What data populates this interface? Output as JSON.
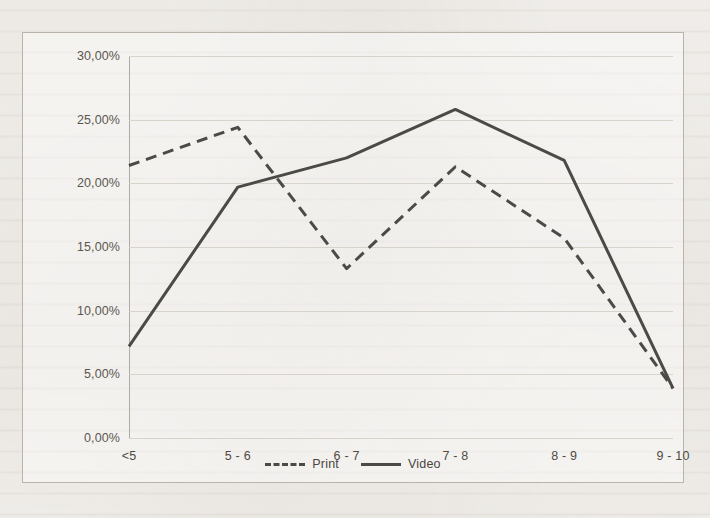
{
  "chart_data": {
    "type": "line",
    "title": "",
    "xlabel": "",
    "ylabel": "",
    "categories": [
      "<5",
      "5 - 6",
      "6 - 7",
      "7 - 8",
      "8 - 9",
      "9 - 10"
    ],
    "series": [
      {
        "name": "Print",
        "style": "dashed",
        "color": "#4c4a47",
        "values": [
          21.4,
          24.4,
          13.3,
          21.3,
          15.7,
          3.9
        ]
      },
      {
        "name": "Video",
        "style": "solid",
        "color": "#4c4a47",
        "values": [
          7.2,
          19.7,
          22.0,
          25.8,
          21.8,
          3.9
        ]
      }
    ],
    "ylim": [
      0,
      30
    ],
    "ytick_values": [
      30,
      25,
      20,
      15,
      10,
      5,
      0
    ],
    "ytick_labels": [
      "30,00%",
      "25,00%",
      "20,00%",
      "15,00%",
      "10,00%",
      "5,00%",
      "0,00%"
    ],
    "grid": true,
    "legend_position": "bottom",
    "value_format": "percent-comma"
  },
  "legend": {
    "entries": [
      {
        "label": "Print",
        "style": "dashed"
      },
      {
        "label": "Video",
        "style": "solid"
      }
    ]
  },
  "colors": {
    "line": "#4c4a47",
    "gridline": "#d8d3cb",
    "axis": "#b0aaa1",
    "frame_border": "#b9b3aa",
    "page_background": "#f3f1ee",
    "tick_text": "#5b564f"
  }
}
